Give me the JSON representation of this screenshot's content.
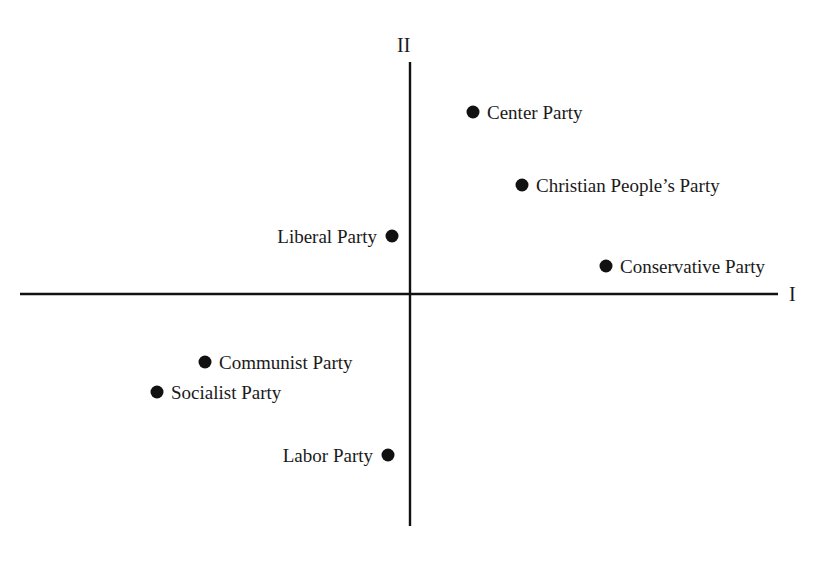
{
  "chart_data": {
    "type": "scatter",
    "title": "",
    "xlabel": "I",
    "ylabel": "II",
    "grid": false,
    "legend": "none",
    "xlim": [
      -3.9,
      3.68
    ],
    "ylim": [
      -2.32,
      2.32
    ],
    "points": [
      {
        "label": "Center Party",
        "x": 0.63,
        "y": 1.82,
        "label_side": "right"
      },
      {
        "label": "Christian People’s Party",
        "x": 1.12,
        "y": 1.09,
        "label_side": "right"
      },
      {
        "label": "Liberal Party",
        "x": -0.18,
        "y": 0.58,
        "label_side": "left"
      },
      {
        "label": "Conservative Party",
        "x": 1.96,
        "y": 0.28,
        "label_side": "right"
      },
      {
        "label": "Communist Party",
        "x": -2.05,
        "y": -0.68,
        "label_side": "right"
      },
      {
        "label": "Socialist Party",
        "x": -2.53,
        "y": -0.98,
        "label_side": "right"
      },
      {
        "label": "Labor Party",
        "x": -0.22,
        "y": -1.61,
        "label_side": "left"
      }
    ]
  },
  "axes": {
    "horizontal_label": "I",
    "vertical_label": "II"
  }
}
